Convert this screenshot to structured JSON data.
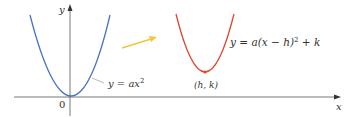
{
  "axes": {
    "x_label": "x",
    "y_label": "y",
    "origin_label": "0"
  },
  "curves": [
    {
      "name": "base-parabola",
      "equation": "y = ax",
      "exponent": "2",
      "color": "#4a72c4"
    },
    {
      "name": "shifted-parabola",
      "equation_part1": "y = a(x − h)",
      "exponent": "2",
      "equation_part2": " + k",
      "color": "#e0452e"
    }
  ],
  "vertex_label": "(h, k)",
  "arrow_color": "#f2c63a"
}
